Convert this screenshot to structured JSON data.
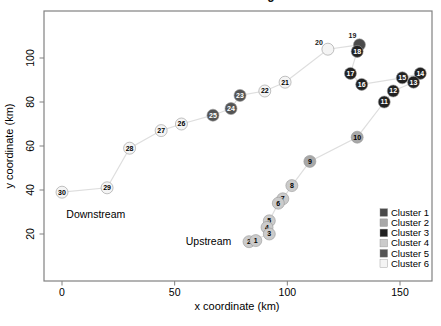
{
  "figure": {
    "truncated_title_fragment": "g",
    "annotations": [
      {
        "text": "Downstream",
        "x": 15,
        "y": 29
      },
      {
        "text": "Upstream",
        "x": 65,
        "y": 16.5
      }
    ]
  },
  "chart_data": {
    "type": "scatter",
    "title": "",
    "xlabel": "x coordinate (km)",
    "ylabel": "y coordinate (km)",
    "xlim": [
      -8,
      164
    ],
    "ylim": [
      -1,
      121
    ],
    "xticks": [
      "0",
      "50",
      "100",
      "150"
    ],
    "xtick_values": [
      0,
      50,
      100,
      150
    ],
    "yticks": [
      "20",
      "40",
      "60",
      "80",
      "100"
    ],
    "ytick_values": [
      20,
      40,
      60,
      80,
      100
    ],
    "grid": false,
    "frame_color": "#818181",
    "connector_line_color": "#dedede",
    "connect_order": "sites joined sequentially by id 1 to 30",
    "clusters": [
      {
        "name": "Cluster 1",
        "color": "#4a4a4a",
        "text_color": "#ffffff"
      },
      {
        "name": "Cluster 2",
        "color": "#a8a8a8",
        "text_color": "#000000"
      },
      {
        "name": "Cluster 3",
        "color": "#212121",
        "text_color": "#ffffff"
      },
      {
        "name": "Cluster 4",
        "color": "#cbcbcb",
        "text_color": "#000000"
      },
      {
        "name": "Cluster 5",
        "color": "#545454",
        "text_color": "#ffffff"
      },
      {
        "name": "Cluster 6",
        "color": "#f4f4f4",
        "text_color": "#000000"
      }
    ],
    "legend": {
      "position": "bottom-right",
      "entries": [
        "Cluster 1",
        "Cluster 2",
        "Cluster 3",
        "Cluster 4",
        "Cluster 5",
        "Cluster 6"
      ]
    },
    "points": [
      {
        "id": 1,
        "label": "1",
        "x": 86,
        "y": 17,
        "cluster": 4
      },
      {
        "id": 2,
        "label": "2",
        "x": 83,
        "y": 16.5,
        "cluster": 4
      },
      {
        "id": 3,
        "label": "3",
        "x": 92,
        "y": 20,
        "cluster": 4
      },
      {
        "id": 4,
        "label": "4",
        "x": 91,
        "y": 23,
        "cluster": 4
      },
      {
        "id": 5,
        "label": "5",
        "x": 92,
        "y": 26,
        "cluster": 4
      },
      {
        "id": 6,
        "label": "6",
        "x": 96,
        "y": 34,
        "cluster": 4
      },
      {
        "id": 7,
        "label": "7",
        "x": 98,
        "y": 36,
        "cluster": 4
      },
      {
        "id": 8,
        "label": "8",
        "x": 102,
        "y": 42,
        "cluster": 4
      },
      {
        "id": 9,
        "label": "9",
        "x": 110,
        "y": 53,
        "cluster": 2
      },
      {
        "id": 10,
        "label": "10",
        "x": 131,
        "y": 64,
        "cluster": 2
      },
      {
        "id": 11,
        "label": "11",
        "x": 143,
        "y": 80,
        "cluster": 3
      },
      {
        "id": 12,
        "label": "12",
        "x": 147,
        "y": 85,
        "cluster": 3
      },
      {
        "id": 13,
        "label": "13",
        "x": 156,
        "y": 89,
        "cluster": 3
      },
      {
        "id": 14,
        "label": "14",
        "x": 159,
        "y": 93,
        "cluster": 3
      },
      {
        "id": 15,
        "label": "15",
        "x": 151,
        "y": 91,
        "cluster": 3
      },
      {
        "id": 16,
        "label": "16",
        "x": 133,
        "y": 88,
        "cluster": 3
      },
      {
        "id": 17,
        "label": "17",
        "x": 128,
        "y": 93,
        "cluster": 3
      },
      {
        "id": 18,
        "label": "18",
        "x": 131,
        "y": 103,
        "cluster": 3
      },
      {
        "id": 19,
        "label": "19",
        "x": 132,
        "y": 106,
        "cluster": 1,
        "label_offset": [
          -7,
          -7
        ]
      },
      {
        "id": 20,
        "label": "20",
        "x": 118,
        "y": 104,
        "cluster": 6,
        "label_offset": [
          -9,
          -4
        ]
      },
      {
        "id": 21,
        "label": "21",
        "x": 99,
        "y": 89,
        "cluster": 6
      },
      {
        "id": 22,
        "label": "22",
        "x": 90,
        "y": 85,
        "cluster": 6
      },
      {
        "id": 23,
        "label": "23",
        "x": 79,
        "y": 83,
        "cluster": 5
      },
      {
        "id": 24,
        "label": "24",
        "x": 75,
        "y": 77,
        "cluster": 5
      },
      {
        "id": 25,
        "label": "25",
        "x": 67,
        "y": 74,
        "cluster": 5
      },
      {
        "id": 26,
        "label": "26",
        "x": 53,
        "y": 70,
        "cluster": 6
      },
      {
        "id": 27,
        "label": "27",
        "x": 44,
        "y": 67,
        "cluster": 6
      },
      {
        "id": 28,
        "label": "28",
        "x": 30,
        "y": 59,
        "cluster": 6
      },
      {
        "id": 29,
        "label": "29",
        "x": 20,
        "y": 41,
        "cluster": 6
      },
      {
        "id": 30,
        "label": "30",
        "x": 0,
        "y": 39,
        "cluster": 6
      }
    ]
  }
}
